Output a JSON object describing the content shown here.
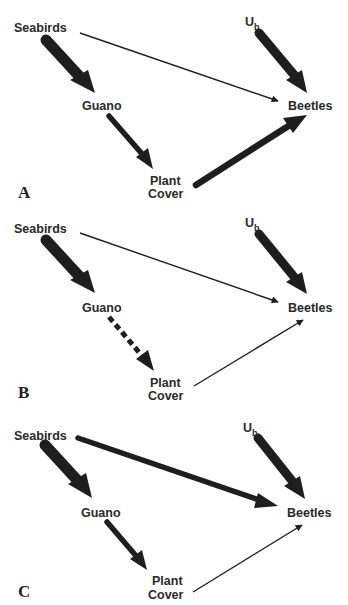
{
  "figure": {
    "panels": [
      {
        "id": "A",
        "label": "A",
        "nodes": {
          "seabirds": "Seabirds",
          "ub": "U",
          "ub_sub": "b",
          "guano": "Guano",
          "beetles": "Beetles",
          "plant_cover_line1": "Plant",
          "plant_cover_line2": "Cover"
        },
        "edges": [
          {
            "from": "Seabirds",
            "to": "Guano",
            "strength": "strong",
            "style": "solid"
          },
          {
            "from": "Seabirds",
            "to": "Beetles",
            "strength": "weak",
            "style": "solid"
          },
          {
            "from": "Ub",
            "to": "Beetles",
            "strength": "strong",
            "style": "solid"
          },
          {
            "from": "Guano",
            "to": "Plant Cover",
            "strength": "medium",
            "style": "solid"
          },
          {
            "from": "Plant Cover",
            "to": "Beetles",
            "strength": "medium-strong",
            "style": "solid"
          }
        ]
      },
      {
        "id": "B",
        "label": "B",
        "nodes": {
          "seabirds": "Seabirds",
          "ub": "U",
          "ub_sub": "b",
          "guano": "Guano",
          "beetles": "Beetles",
          "plant_cover_line1": "Plant",
          "plant_cover_line2": "Cover"
        },
        "edges": [
          {
            "from": "Seabirds",
            "to": "Guano",
            "strength": "strong",
            "style": "solid"
          },
          {
            "from": "Seabirds",
            "to": "Beetles",
            "strength": "weak",
            "style": "solid"
          },
          {
            "from": "Ub",
            "to": "Beetles",
            "strength": "strong",
            "style": "solid"
          },
          {
            "from": "Guano",
            "to": "Plant Cover",
            "strength": "medium",
            "style": "dashed"
          },
          {
            "from": "Plant Cover",
            "to": "Beetles",
            "strength": "weak",
            "style": "solid"
          }
        ]
      },
      {
        "id": "C",
        "label": "C",
        "nodes": {
          "seabirds": "Seabirds",
          "ub": "U",
          "ub_sub": "b",
          "guano": "Guano",
          "beetles": "Beetles",
          "plant_cover_line1": "Plant",
          "plant_cover_line2": "Cover"
        },
        "edges": [
          {
            "from": "Seabirds",
            "to": "Guano",
            "strength": "strong",
            "style": "solid"
          },
          {
            "from": "Seabirds",
            "to": "Beetles",
            "strength": "medium-strong",
            "style": "solid"
          },
          {
            "from": "Ub",
            "to": "Beetles",
            "strength": "strong",
            "style": "solid"
          },
          {
            "from": "Guano",
            "to": "Plant Cover",
            "strength": "medium",
            "style": "solid"
          },
          {
            "from": "Plant Cover",
            "to": "Beetles",
            "strength": "weak",
            "style": "solid"
          }
        ]
      }
    ],
    "colors": {
      "arrow": "#1e1e1e",
      "text": "#2a2a2a",
      "background": "#ffffff"
    }
  }
}
